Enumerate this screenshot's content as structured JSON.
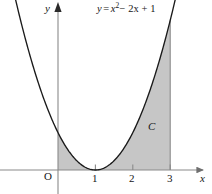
{
  "figure": {
    "equation_label": {
      "y": "y",
      "equals": "=",
      "x_base": "x",
      "exponent": "2",
      "rest": "− 2x + 1",
      "full": "y = x² − 2x + 1"
    },
    "axes": {
      "x_label": "x",
      "y_label": "y",
      "origin_label": "O",
      "x_ticks": [
        "1",
        "2",
        "3"
      ],
      "x_tick_values": [
        1,
        2,
        3
      ]
    },
    "region_label": "C",
    "colors": {
      "background": "#ffffff",
      "curve": "#1a1a1a",
      "axis": "#8a8a8a",
      "shade_fill": "#c6c6c6",
      "shade_edge": "#8a8a8a",
      "text": "#161616"
    }
  },
  "chart_data": {
    "type": "line",
    "xlabel": "x",
    "ylabel": "y",
    "xlim": [
      -1.15,
      3.8
    ],
    "ylim": [
      -0.35,
      4.5
    ],
    "grid": false,
    "legend": null,
    "function": "y = x^2 - 2x + 1",
    "vertex": [
      1,
      0
    ],
    "x": [
      -1.15,
      -1.0,
      -0.75,
      -0.5,
      -0.25,
      0,
      0.25,
      0.5,
      0.75,
      1.0,
      1.25,
      1.5,
      1.75,
      2.0,
      2.25,
      2.5,
      2.75,
      3.0,
      3.25,
      3.4
    ],
    "y": [
      4.62,
      4.0,
      3.06,
      2.25,
      1.56,
      1.0,
      0.5625,
      0.25,
      0.0625,
      0,
      0.0625,
      0.25,
      0.5625,
      1.0,
      1.5625,
      2.25,
      3.0625,
      4.0,
      5.0625,
      5.76
    ],
    "shaded_region": {
      "label": "C",
      "x_from": 0,
      "x_to": 3,
      "bounded_above_by": "y = x^2 - 2x + 1",
      "bounded_below_by": "y = 0",
      "fill": "#c6c6c6"
    },
    "annotations": [
      {
        "text": "y = x² − 2x + 1",
        "x": 1.9,
        "y": 4.3
      },
      {
        "text": "C",
        "x": 2.4,
        "y": 1.35
      },
      {
        "text": "O",
        "x": -0.35,
        "y": -0.22
      }
    ],
    "axis_ticks": {
      "x": [
        1,
        2,
        3
      ],
      "y": []
    }
  }
}
